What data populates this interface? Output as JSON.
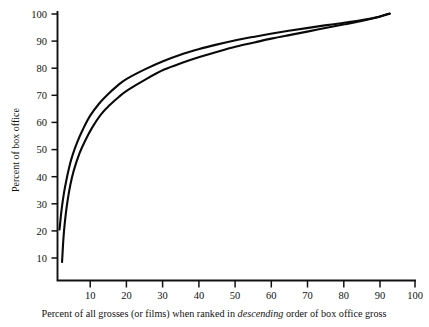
{
  "chart_data": {
    "type": "line",
    "title": "",
    "subtitle": "",
    "xlabel": "Percent of all grosses (or films) when ranked in descending order of box office gross",
    "ylabel": "Percent of box office",
    "xlabel_parts": {
      "before": "Percent of all grosses (or films) when ranked in ",
      "emphasis": "descending",
      "after": " order of box office gross"
    },
    "xlim": [
      0,
      100
    ],
    "ylim": [
      0,
      100
    ],
    "grid": false,
    "legend": "none",
    "xticks": [
      10,
      20,
      30,
      40,
      50,
      60,
      70,
      80,
      90,
      100
    ],
    "yticks": [
      10,
      20,
      30,
      40,
      50,
      60,
      70,
      80,
      90,
      100
    ],
    "xtick_labels": [
      "10",
      "20",
      "30",
      "40",
      "50",
      "60",
      "70",
      "80",
      "90",
      "100"
    ],
    "ytick_labels": [
      "10",
      "20",
      "30",
      "40",
      "50",
      "60",
      "70",
      "80",
      "90",
      "100"
    ],
    "series": [
      {
        "name": "upper-curve",
        "color": "#0a0a0a",
        "x": [
          1.5,
          2.0,
          2.5,
          3.0,
          4.0,
          5.0,
          6.5,
          8.0,
          10.0,
          12.5,
          15.0,
          17.5,
          20.0,
          25.0,
          30.0,
          35.0,
          40.0,
          45.0,
          50.0,
          55.0,
          60.0,
          65.0,
          70.0,
          75.0,
          80.0,
          85.0,
          90.0,
          93.0
        ],
        "y": [
          20.5,
          27.0,
          32.0,
          36.0,
          42.5,
          47.5,
          53.0,
          57.5,
          62.5,
          67.0,
          70.5,
          73.5,
          76.0,
          79.5,
          82.5,
          85.0,
          87.0,
          88.7,
          90.2,
          91.5,
          92.7,
          93.8,
          94.8,
          95.8,
          96.7,
          97.7,
          99.0,
          100.2
        ]
      },
      {
        "name": "lower-curve",
        "color": "#0a0a0a",
        "x": [
          2.2,
          2.6,
          3.0,
          3.6,
          4.5,
          5.5,
          7.0,
          8.5,
          10.5,
          13.0,
          15.5,
          18.0,
          20.5,
          25.5,
          30.5,
          35.5,
          40.5,
          45.5,
          50.5,
          55.5,
          60.5,
          65.5,
          70.5,
          75.5,
          80.5,
          85.5,
          90.0,
          93.0
        ],
        "y": [
          8.5,
          17.5,
          23.5,
          30.0,
          37.0,
          42.5,
          48.5,
          53.0,
          58.0,
          63.0,
          66.5,
          69.5,
          72.0,
          76.0,
          79.5,
          82.0,
          84.2,
          86.2,
          88.0,
          89.5,
          91.0,
          92.3,
          93.6,
          94.9,
          96.2,
          97.5,
          98.9,
          100.1
        ]
      }
    ]
  },
  "axes": {
    "x_axis_name": "x-axis",
    "y_axis_name": "y-axis"
  }
}
